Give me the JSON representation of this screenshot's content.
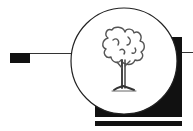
{
  "figure": {
    "type": "logo-emblem",
    "colors": {
      "background": "#ffffff",
      "ink": "#111111",
      "line": "#333333",
      "tree": "#555555"
    },
    "icon": "tree-icon"
  }
}
